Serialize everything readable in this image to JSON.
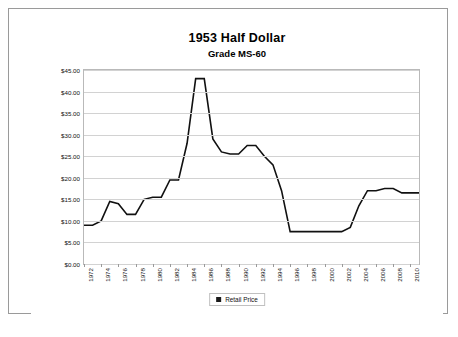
{
  "page": {
    "background": "#ffffff",
    "frame_color": "#9a9a9a"
  },
  "legend": {
    "label": "Retail Price",
    "swatch_color": "#1a1a1a"
  },
  "chart_data": {
    "type": "line",
    "title": "1953 Half Dollar",
    "subtitle": "Grade MS-60",
    "xlabel": "",
    "ylabel": "",
    "grid": true,
    "legend_position": "bottom-center",
    "series_color": "#111111",
    "ylim": [
      0,
      45
    ],
    "ytick_labels": [
      "$0.00",
      "$5.00",
      "$10.00",
      "$15.00",
      "$20.00",
      "$25.00",
      "$30.00",
      "$35.00",
      "$40.00",
      "$45.00"
    ],
    "ytick_values": [
      0,
      5,
      10,
      15,
      20,
      25,
      30,
      35,
      40,
      45
    ],
    "xtick_labels": [
      "1972",
      "1974",
      "1976",
      "1978",
      "1980",
      "1982",
      "1984",
      "1986",
      "1988",
      "1990",
      "1992",
      "1994",
      "1996",
      "1998",
      "2000",
      "2002",
      "2004",
      "2006",
      "2008",
      "2010"
    ],
    "x": [
      1972,
      1973,
      1974,
      1975,
      1976,
      1977,
      1978,
      1979,
      1980,
      1981,
      1982,
      1983,
      1984,
      1985,
      1986,
      1987,
      1988,
      1989,
      1990,
      1991,
      1992,
      1993,
      1994,
      1995,
      1996,
      1997,
      1998,
      1999,
      2000,
      2001,
      2002,
      2003,
      2004,
      2005,
      2006,
      2007,
      2008,
      2009,
      2010,
      2011
    ],
    "series": [
      {
        "name": "Retail Price",
        "values": [
          9.0,
          9.0,
          10.0,
          14.5,
          14.0,
          11.5,
          11.5,
          15.0,
          15.5,
          15.5,
          19.5,
          19.5,
          28.0,
          43.0,
          43.0,
          29.0,
          26.0,
          25.5,
          25.5,
          27.5,
          27.5,
          25.0,
          23.0,
          17.0,
          7.5,
          7.5,
          7.5,
          7.5,
          7.5,
          7.5,
          7.5,
          8.5,
          13.5,
          17.0,
          17.0,
          17.5,
          17.5,
          16.5,
          16.5,
          16.5
        ]
      }
    ]
  }
}
